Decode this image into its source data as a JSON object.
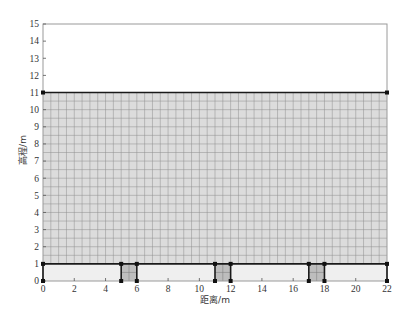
{
  "chart_data": {
    "type": "area",
    "title": "",
    "xlabel": "距离/m",
    "ylabel": "高程/m",
    "xlim": [
      0,
      22
    ],
    "ylim": [
      0,
      15
    ],
    "xticks": [
      0,
      2,
      4,
      6,
      8,
      10,
      12,
      14,
      16,
      18,
      20,
      22
    ],
    "yticks": [
      0,
      1,
      2,
      3,
      4,
      5,
      6,
      7,
      8,
      9,
      10,
      11,
      12,
      13,
      14,
      15
    ],
    "grid": false,
    "legend": null,
    "regions": [
      {
        "name": "upper-domain",
        "x": [
          0,
          22
        ],
        "y": [
          1,
          11
        ],
        "fill": "#dcdcdc",
        "mesh_spacing": 0.5,
        "mesh_color": "#8f8f8f"
      },
      {
        "name": "base-layer",
        "x": [
          0,
          22
        ],
        "y": [
          0,
          1
        ],
        "fill": "#efefef",
        "mesh_spacing": null
      },
      {
        "name": "block-1",
        "x": [
          5,
          6
        ],
        "y": [
          0,
          1
        ],
        "fill": "#bdbdbd",
        "mesh_spacing": 0.5,
        "mesh_color": "#7a7a7a"
      },
      {
        "name": "block-2",
        "x": [
          11,
          12
        ],
        "y": [
          0,
          1
        ],
        "fill": "#bdbdbd",
        "mesh_spacing": 0.5,
        "mesh_color": "#7a7a7a"
      },
      {
        "name": "block-3",
        "x": [
          17,
          18
        ],
        "y": [
          0,
          1
        ],
        "fill": "#bdbdbd",
        "mesh_spacing": 0.5,
        "mesh_color": "#7a7a7a"
      }
    ],
    "boundary_lines": [
      {
        "name": "top-boundary-line",
        "points": [
          [
            0,
            11
          ],
          [
            22,
            11
          ]
        ]
      },
      {
        "name": "interface-line",
        "points": [
          [
            0,
            1
          ],
          [
            22,
            1
          ]
        ]
      },
      {
        "name": "left-base-edge",
        "points": [
          [
            0,
            0
          ],
          [
            0,
            1
          ]
        ]
      },
      {
        "name": "right-base-edge",
        "points": [
          [
            22,
            0
          ],
          [
            22,
            1
          ]
        ]
      },
      {
        "name": "block-1-left",
        "points": [
          [
            5,
            0
          ],
          [
            5,
            1
          ]
        ]
      },
      {
        "name": "block-1-right",
        "points": [
          [
            6,
            0
          ],
          [
            6,
            1
          ]
        ]
      },
      {
        "name": "block-2-left",
        "points": [
          [
            11,
            0
          ],
          [
            11,
            1
          ]
        ]
      },
      {
        "name": "block-2-right",
        "points": [
          [
            12,
            0
          ],
          [
            12,
            1
          ]
        ]
      },
      {
        "name": "block-3-left",
        "points": [
          [
            17,
            0
          ],
          [
            17,
            1
          ]
        ]
      },
      {
        "name": "block-3-right",
        "points": [
          [
            18,
            0
          ],
          [
            18,
            1
          ]
        ]
      }
    ],
    "nodes": [
      [
        0,
        0
      ],
      [
        0,
        1
      ],
      [
        0,
        11
      ],
      [
        22,
        11
      ],
      [
        22,
        1
      ],
      [
        22,
        0
      ],
      [
        5,
        0
      ],
      [
        5,
        1
      ],
      [
        6,
        0
      ],
      [
        6,
        1
      ],
      [
        11,
        0
      ],
      [
        11,
        1
      ],
      [
        12,
        0
      ],
      [
        12,
        1
      ],
      [
        17,
        0
      ],
      [
        17,
        1
      ],
      [
        18,
        0
      ],
      [
        18,
        1
      ]
    ],
    "colors": {
      "frame": "#9a9a9a",
      "boundary": "#1a1a1a",
      "node": "#111111"
    }
  }
}
